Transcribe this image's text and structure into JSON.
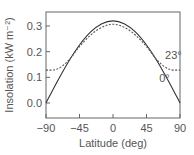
{
  "chart_data": {
    "type": "line",
    "title": "",
    "xlabel": "Latitude (deg)",
    "ylabel": "Insolation (kW m⁻²)",
    "xlim": [
      -90,
      90
    ],
    "ylim": [
      -0.05,
      0.35
    ],
    "xticks": [
      -90,
      -45,
      0,
      45,
      90
    ],
    "xtick_labels": [
      "−90",
      "−45",
      "0",
      "45",
      "90"
    ],
    "yticks": [
      0.0,
      0.1,
      0.2,
      0.3
    ],
    "ytick_labels": [
      "0.0",
      "0.1",
      "0.2",
      "0.3"
    ],
    "grid": false,
    "x": [
      -90,
      -75,
      -60,
      -45,
      -30,
      -15,
      0,
      15,
      30,
      45,
      60,
      75,
      90
    ],
    "series": [
      {
        "name": "0°",
        "style": "solid",
        "values": [
          0.0,
          0.083,
          0.16,
          0.226,
          0.277,
          0.309,
          0.32,
          0.309,
          0.277,
          0.226,
          0.16,
          0.083,
          0.0
        ]
      },
      {
        "name": "23°",
        "style": "dashed",
        "values": [
          0.128,
          0.132,
          0.165,
          0.22,
          0.265,
          0.295,
          0.307,
          0.295,
          0.265,
          0.22,
          0.165,
          0.132,
          0.128
        ]
      }
    ],
    "annotations": [
      {
        "text": "23°",
        "x": 70,
        "y": 0.17
      },
      {
        "text": "0°",
        "x": 62,
        "y": 0.08
      }
    ]
  }
}
